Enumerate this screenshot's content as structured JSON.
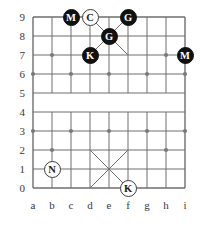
{
  "board": {
    "title": "Janggi board position",
    "file_labels": [
      "a",
      "b",
      "c",
      "d",
      "e",
      "f",
      "g",
      "h",
      "i"
    ],
    "rank_labels": [
      "9",
      "8",
      "7",
      "6",
      "5",
      "4",
      "3",
      "2",
      "1",
      "0"
    ],
    "colors": {
      "line": "#6e6e6e",
      "border": "#555555",
      "marker": "#7a7a7a",
      "black_piece": "#111111",
      "white_piece": "#ffffff",
      "label_text": "#3a3a3a"
    },
    "geometry": {
      "left": 33,
      "top": 17,
      "cell_width": 19,
      "cell_height": 19,
      "files": 9,
      "ranks": 10,
      "river_rank_low": 4,
      "river_rank_high": 5
    },
    "palaces": [
      {
        "name": "top-palace",
        "files": [
          "d",
          "f"
        ],
        "ranks": [
          7,
          9
        ]
      },
      {
        "name": "bottom-palace",
        "files": [
          "d",
          "f"
        ],
        "ranks": [
          0,
          2
        ]
      }
    ],
    "markers": [
      {
        "file": "b",
        "rank": 7
      },
      {
        "file": "h",
        "rank": 7
      },
      {
        "file": "a",
        "rank": 6
      },
      {
        "file": "c",
        "rank": 6
      },
      {
        "file": "e",
        "rank": 6
      },
      {
        "file": "g",
        "rank": 6
      },
      {
        "file": "i",
        "rank": 6
      },
      {
        "file": "a",
        "rank": 3
      },
      {
        "file": "c",
        "rank": 3
      },
      {
        "file": "e",
        "rank": 3
      },
      {
        "file": "g",
        "rank": 3
      },
      {
        "file": "i",
        "rank": 3
      },
      {
        "file": "b",
        "rank": 2
      },
      {
        "file": "h",
        "rank": 2
      }
    ],
    "pieces": [
      {
        "id": "piece-m-c9",
        "label": "M",
        "color": "black",
        "file": "c",
        "rank": 9
      },
      {
        "id": "piece-c-d9",
        "label": "C",
        "color": "white",
        "file": "d",
        "rank": 9
      },
      {
        "id": "piece-g-f9",
        "label": "G",
        "color": "black",
        "file": "f",
        "rank": 9
      },
      {
        "id": "piece-g-e8",
        "label": "G",
        "color": "black",
        "file": "e",
        "rank": 8
      },
      {
        "id": "piece-k-d7",
        "label": "K",
        "color": "black",
        "file": "d",
        "rank": 7
      },
      {
        "id": "piece-m-i7",
        "label": "M",
        "color": "black",
        "file": "i",
        "rank": 7
      },
      {
        "id": "piece-n-b1",
        "label": "N",
        "color": "white",
        "file": "b",
        "rank": 1
      },
      {
        "id": "piece-k-f0",
        "label": "K",
        "color": "white",
        "file": "f",
        "rank": 0
      }
    ]
  }
}
